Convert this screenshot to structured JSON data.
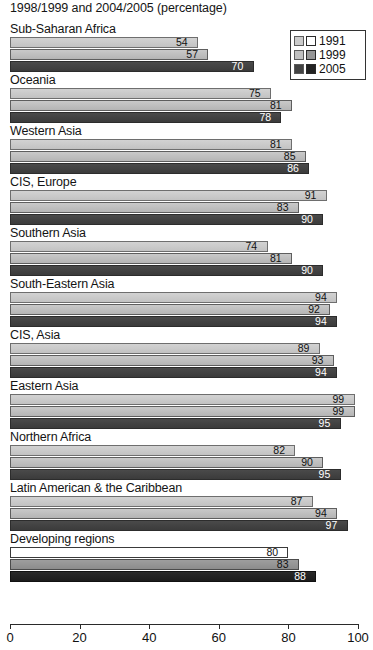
{
  "chart_data": {
    "type": "bar",
    "orientation": "horizontal",
    "title": "1998/1999 and 2004/2005 (percentage)",
    "xlabel": "",
    "ylabel": "",
    "xlim": [
      0,
      100
    ],
    "grid": false,
    "legend_position": "top-right",
    "legend": {
      "entries": [
        {
          "label": "1991",
          "color_default": "#cbcbcb",
          "color_highlight": "#ffffff"
        },
        {
          "label": "1999",
          "color_default": "#c0c0c0",
          "color_highlight": "#969696"
        },
        {
          "label": "2005",
          "color_default": "#434343",
          "color_highlight": "#232323"
        }
      ]
    },
    "series": [
      {
        "name": "1991",
        "values": [
          54,
          75,
          81,
          91,
          74,
          94,
          89,
          99,
          82,
          87,
          80
        ]
      },
      {
        "name": "1999",
        "values": [
          57,
          81,
          85,
          83,
          81,
          92,
          93,
          99,
          90,
          94,
          83
        ]
      },
      {
        "name": "2005",
        "values": [
          70,
          78,
          86,
          90,
          90,
          94,
          94,
          95,
          95,
          97,
          88
        ]
      }
    ],
    "categories": [
      "Sub-Saharan Africa",
      "Oceania",
      "Western Asia",
      "CIS, Europe",
      "Southern Asia",
      "South-Eastern Asia",
      "CIS, Asia",
      "Eastern Asia",
      "Northern Africa",
      "Latin American & the Caribbean",
      "Developing regions"
    ],
    "highlight_category": "Developing regions",
    "xticks": [
      0,
      20,
      40,
      60,
      80,
      100
    ],
    "xticklabels": [
      "0",
      "20",
      "40",
      "60",
      "80",
      "100"
    ]
  }
}
